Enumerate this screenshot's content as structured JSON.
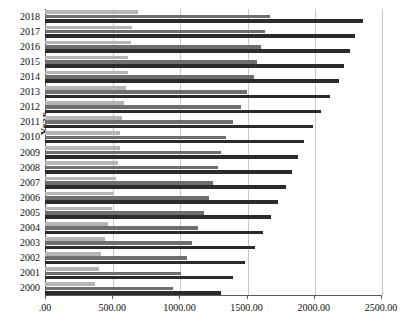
{
  "chart": {
    "type": "bar-horizontal-grouped",
    "title": "",
    "ylabel": "Year",
    "xlabel": "",
    "axis": {
      "x_min": 0,
      "x_max": 2500,
      "x_ticks": [
        0,
        500,
        1000,
        1500,
        2000,
        2500
      ],
      "x_tick_labels": [
        ".00",
        "500.00",
        "1000.00",
        "1500.00",
        "2000.00",
        "2500.00"
      ],
      "grid": "vertical"
    },
    "colors": {
      "series1": "#b5b5b5",
      "series2": "#6e6e6e",
      "series3": "#2b2b2b",
      "grid": "#c8c8c8",
      "axis": "#5a5a5a",
      "background": "#ffffff"
    }
  },
  "chart_data": {
    "type": "bar",
    "title": "",
    "xlabel": "",
    "ylabel": "Year",
    "xlim": [
      0,
      2500
    ],
    "grid": true,
    "orientation": "horizontal",
    "legend": "none",
    "categories": [
      "2018",
      "2017",
      "2016",
      "2015",
      "2014",
      "2013",
      "2012",
      "2011",
      "2010",
      "2009",
      "2008",
      "2007",
      "2006",
      "2005",
      "2004",
      "2003",
      "2002",
      "2001",
      "2000"
    ],
    "series": [
      {
        "name": "series-1",
        "color": "#b5b5b5",
        "values": [
          690,
          645,
          640,
          620,
          615,
          605,
          585,
          570,
          560,
          555,
          545,
          530,
          515,
          495,
          470,
          450,
          420,
          400,
          372
        ]
      },
      {
        "name": "series-2",
        "color": "#6e6e6e",
        "values": [
          1675,
          1640,
          1610,
          1580,
          1555,
          1500,
          1455,
          1400,
          1350,
          1310,
          1285,
          1250,
          1220,
          1185,
          1140,
          1095,
          1060,
          1010,
          950
        ]
      },
      {
        "name": "series-3",
        "color": "#2b2b2b",
        "values": [
          2365,
          2310,
          2270,
          2225,
          2185,
          2120,
          2050,
          1995,
          1930,
          1880,
          1840,
          1790,
          1735,
          1680,
          1620,
          1560,
          1490,
          1400,
          1310
        ]
      }
    ]
  }
}
